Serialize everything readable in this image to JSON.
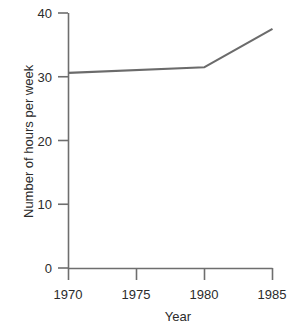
{
  "chart_data": {
    "type": "line",
    "title": "",
    "subtitle": "",
    "xlabel": "Year",
    "ylabel": "Number of hours per week",
    "x": [
      1970,
      1980,
      1985
    ],
    "values": [
      30.6,
      31.5,
      37.5
    ],
    "series": [
      {
        "name": "Number of hours per week",
        "x": [
          1970,
          1980,
          1985
        ],
        "values": [
          30.6,
          31.5,
          37.5
        ]
      }
    ],
    "xlim": [
      1970,
      1985
    ],
    "ylim": [
      0,
      40
    ],
    "xticks": [
      1970,
      1975,
      1980,
      1985
    ],
    "xticklabels": [
      "1970",
      "1975",
      "1980",
      "1985"
    ],
    "yticks": [
      0,
      10,
      20,
      30,
      40
    ],
    "yticklabels": [
      "0",
      "10",
      "20",
      "30",
      "40"
    ],
    "grid": false,
    "legend": false,
    "legend_position": "none",
    "annotations": [],
    "line_color": "#6b6b6b",
    "axis_color": "#6e6e6e",
    "background_color": "#ffffff"
  },
  "axes": {
    "y_tick_labels": [
      {
        "label": "40"
      },
      {
        "label": "30"
      },
      {
        "label": "20"
      },
      {
        "label": "10"
      },
      {
        "label": "0"
      }
    ],
    "x_tick_labels": [
      {
        "label": "1970"
      },
      {
        "label": "1975"
      },
      {
        "label": "1980"
      },
      {
        "label": "1985"
      }
    ],
    "x_title": "Year",
    "y_title": "Number of hours per week"
  }
}
